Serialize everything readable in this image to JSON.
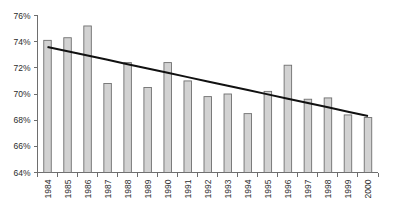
{
  "chart_data": {
    "type": "bar",
    "title": "",
    "subtitle": "",
    "xlabel": "",
    "ylabel": "",
    "categories": [
      "1984",
      "1985",
      "1986",
      "1987",
      "1988",
      "1989",
      "1990",
      "1991",
      "1992",
      "1993",
      "1994",
      "1995",
      "1996",
      "1997",
      "1998",
      "1999",
      "2000"
    ],
    "values": [
      74.1,
      74.3,
      75.2,
      70.8,
      72.4,
      70.5,
      72.4,
      71.0,
      69.8,
      70.0,
      68.5,
      70.2,
      72.2,
      69.6,
      69.7,
      68.4,
      68.2
    ],
    "series": [
      {
        "name": "annual value",
        "type": "bar",
        "values": [
          74.1,
          74.3,
          75.2,
          70.8,
          72.4,
          70.5,
          72.4,
          71.0,
          69.8,
          70.0,
          68.5,
          70.2,
          72.2,
          69.6,
          69.7,
          68.4,
          68.2
        ]
      },
      {
        "name": "trend line",
        "type": "line",
        "values": [
          73.6,
          73.27,
          72.94,
          72.61,
          72.28,
          71.95,
          71.62,
          71.29,
          70.96,
          70.63,
          70.3,
          69.97,
          69.64,
          69.31,
          68.98,
          68.65,
          68.32
        ]
      }
    ],
    "ylim": [
      64,
      76
    ],
    "ytick_values": [
      64,
      66,
      68,
      70,
      72,
      74,
      76
    ],
    "ytick_labels": [
      "64%",
      "66%",
      "68%",
      "70%",
      "72%",
      "74%",
      "76%"
    ],
    "xtick_labels": [
      "1984",
      "1985",
      "1986",
      "1987",
      "1988",
      "1989",
      "1990",
      "1991",
      "1992",
      "1993",
      "1994",
      "1995",
      "1996",
      "1997",
      "1998",
      "1999",
      "2000"
    ],
    "grid": false,
    "legend": null,
    "legend_position": "none",
    "annotations": [],
    "colors": {
      "bar_fill": "#d2d2d2",
      "bar_stroke": "#6f6f6f",
      "trend_line": "#111111",
      "axis": "#6e6e6e",
      "text": "#2b2b2b",
      "background": "#ffffff"
    }
  }
}
